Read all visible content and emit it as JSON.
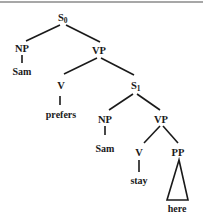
{
  "diagram": {
    "type": "syntax-tree",
    "nodes": {
      "s0": {
        "label": "S",
        "subscript": "0"
      },
      "np1": {
        "label": "NP"
      },
      "sam1": {
        "label": "Sam"
      },
      "vp1": {
        "label": "VP"
      },
      "v1": {
        "label": "V"
      },
      "prefers": {
        "label": "prefers"
      },
      "s1": {
        "label": "S",
        "subscript": "1"
      },
      "np2": {
        "label": "NP"
      },
      "sam2": {
        "label": "Sam"
      },
      "vp2": {
        "label": "VP"
      },
      "v2": {
        "label": "V"
      },
      "stay": {
        "label": "stay"
      },
      "pp": {
        "label": "PP"
      },
      "here": {
        "label": "here"
      }
    },
    "edges": [
      [
        "S0",
        "NP"
      ],
      [
        "S0",
        "VP"
      ],
      [
        "NP",
        "Sam"
      ],
      [
        "VP",
        "V"
      ],
      [
        "VP",
        "S1"
      ],
      [
        "V",
        "prefers"
      ],
      [
        "S1",
        "NP"
      ],
      [
        "S1",
        "VP"
      ],
      [
        "NP",
        "Sam"
      ],
      [
        "VP",
        "V"
      ],
      [
        "VP",
        "PP"
      ],
      [
        "V",
        "stay"
      ],
      [
        "PP",
        "here (triangle)"
      ]
    ]
  }
}
